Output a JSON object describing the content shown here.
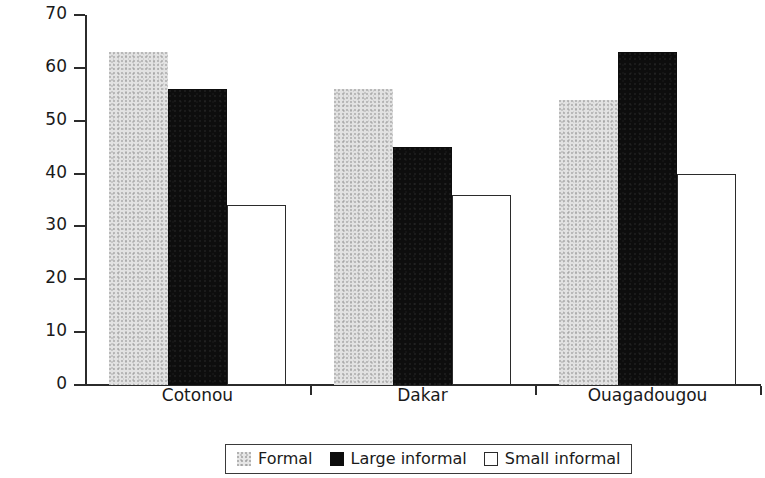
{
  "chart_data": {
    "type": "bar",
    "title": "",
    "xlabel": "",
    "ylabel": "% of firms",
    "ylim": [
      0,
      70
    ],
    "yticks": [
      0,
      10,
      20,
      30,
      40,
      50,
      60,
      70
    ],
    "grid": false,
    "legend_position": "bottom-center",
    "categories": [
      "Cotonou",
      "Dakar",
      "Ouagadougou"
    ],
    "series": [
      {
        "name": "Formal",
        "values": [
          63,
          56,
          54
        ],
        "color": "#e2e2e2",
        "style": "light-gray-stipple"
      },
      {
        "name": "Large informal",
        "values": [
          56,
          45,
          63
        ],
        "color": "#0d0d0d",
        "style": "solid-black"
      },
      {
        "name": "Small informal",
        "values": [
          34,
          36,
          40
        ],
        "color": "#ffffff",
        "style": "white-outlined"
      }
    ]
  },
  "axis": {
    "y_title": "% of firms",
    "y_tick_labels": [
      "70",
      "60",
      "50",
      "40",
      "30",
      "20",
      "10",
      "0"
    ]
  },
  "legend": {
    "items": [
      {
        "label": "Formal",
        "swatch": "light-gray-swatch"
      },
      {
        "label": "Large informal",
        "swatch": "black-swatch"
      },
      {
        "label": "Small informal",
        "swatch": "white-outline-swatch"
      }
    ]
  }
}
